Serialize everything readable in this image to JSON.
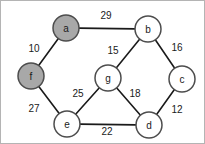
{
  "figure": {
    "background_color": "#ffffff",
    "border_color": "#b4b4b4",
    "edge_color": "#1a1a1a",
    "node_fill_highlight": "#a8a8a8",
    "node_fill_plain": "#ffffff",
    "node_stroke": "#4d4d4d"
  },
  "chart_data": {
    "type": "diagram",
    "title": "",
    "nodes": [
      {
        "id": "a",
        "label": "a",
        "x": 65,
        "y": 27,
        "r": 13,
        "highlighted": true
      },
      {
        "id": "b",
        "label": "b",
        "x": 147,
        "y": 28,
        "r": 13,
        "highlighted": false
      },
      {
        "id": "c",
        "label": "c",
        "x": 181,
        "y": 78,
        "r": 13,
        "highlighted": false
      },
      {
        "id": "d",
        "label": "d",
        "x": 148,
        "y": 124,
        "r": 13,
        "highlighted": false
      },
      {
        "id": "e",
        "label": "e",
        "x": 66,
        "y": 123,
        "r": 13,
        "highlighted": false
      },
      {
        "id": "f",
        "label": "f",
        "x": 30,
        "y": 75,
        "r": 13,
        "highlighted": true
      },
      {
        "id": "g",
        "label": "g",
        "x": 107,
        "y": 77,
        "r": 13,
        "highlighted": false
      }
    ],
    "edges": [
      {
        "source": "a",
        "target": "b",
        "weight": "29",
        "label_x": 105,
        "label_y": 14
      },
      {
        "source": "a",
        "target": "f",
        "weight": "10",
        "label_x": 33,
        "label_y": 47
      },
      {
        "source": "b",
        "target": "g",
        "weight": "15",
        "label_x": 112,
        "label_y": 49
      },
      {
        "source": "b",
        "target": "c",
        "weight": "16",
        "label_x": 176,
        "label_y": 46
      },
      {
        "source": "c",
        "target": "d",
        "weight": "12",
        "label_x": 176,
        "label_y": 108
      },
      {
        "source": "d",
        "target": "g",
        "weight": "18",
        "label_x": 134,
        "label_y": 92
      },
      {
        "source": "d",
        "target": "e",
        "weight": "22",
        "label_x": 106,
        "label_y": 130
      },
      {
        "source": "e",
        "target": "g",
        "weight": "25",
        "label_x": 77,
        "label_y": 92
      },
      {
        "source": "e",
        "target": "f",
        "weight": "27",
        "label_x": 33,
        "label_y": 107
      }
    ]
  }
}
